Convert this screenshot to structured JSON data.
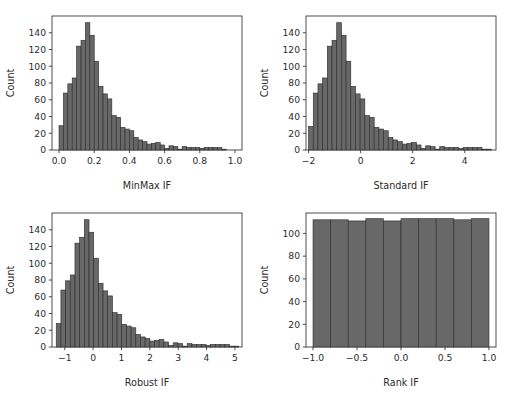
{
  "figure": {
    "title": "",
    "layout": "2x2 grid of histograms",
    "background_color": "#ffffff",
    "bar_color": "#686868",
    "bar_edge_color": "#2f2f2f",
    "axis_color": "#3a3a3a"
  },
  "chart_data": [
    {
      "type": "bar",
      "panel": "top-left",
      "title": "",
      "xlabel": "MinMax IF",
      "ylabel": "Count",
      "grid": false,
      "legend": "none",
      "xlim": [
        -0.04,
        1.04
      ],
      "ylim": [
        0,
        160
      ],
      "xticks": [
        0.0,
        0.2,
        0.4,
        0.6,
        0.8,
        1.0
      ],
      "xticklabels": [
        "0.0",
        "0.2",
        "0.4",
        "0.6",
        "0.8",
        "1.0"
      ],
      "yticks": [
        0,
        20,
        40,
        60,
        80,
        100,
        120,
        140
      ],
      "yticklabels": [
        "0",
        "20",
        "40",
        "60",
        "80",
        "100",
        "120",
        "140"
      ],
      "bin_edges": [
        0.0,
        0.025,
        0.05,
        0.075,
        0.1,
        0.125,
        0.15,
        0.175,
        0.2,
        0.225,
        0.25,
        0.275,
        0.3,
        0.325,
        0.35,
        0.375,
        0.4,
        0.425,
        0.45,
        0.475,
        0.5,
        0.525,
        0.55,
        0.575,
        0.6,
        0.625,
        0.65,
        0.675,
        0.7,
        0.725,
        0.75,
        0.775,
        0.8,
        0.825,
        0.85,
        0.875,
        0.9,
        0.925,
        0.95,
        0.975,
        1.0
      ],
      "values": [
        29,
        68,
        79,
        86,
        124,
        131,
        152,
        137,
        106,
        76,
        67,
        61,
        41,
        39,
        27,
        25,
        23,
        15,
        12,
        10,
        7,
        8,
        9,
        6,
        2,
        5,
        4,
        1,
        4,
        3,
        3,
        3,
        2,
        3,
        3,
        3,
        3,
        1
      ]
    },
    {
      "type": "bar",
      "panel": "top-right",
      "title": "",
      "xlabel": "Standard IF",
      "ylabel": "Count",
      "grid": false,
      "legend": "none",
      "xlim": [
        -2.1,
        5.2
      ],
      "ylim": [
        0,
        160
      ],
      "xticks": [
        -2,
        0,
        2,
        4
      ],
      "xticklabels": [
        "-2",
        "0",
        "2",
        "4"
      ],
      "yticks": [
        0,
        20,
        40,
        60,
        80,
        100,
        120,
        140
      ],
      "yticklabels": [
        "0",
        "20",
        "40",
        "60",
        "80",
        "100",
        "120",
        "140"
      ],
      "bin_edges": [
        -2.0,
        -1.82,
        -1.64,
        -1.46,
        -1.28,
        -1.1,
        -0.92,
        -0.74,
        -0.56,
        -0.38,
        -0.2,
        -0.02,
        0.16,
        0.34,
        0.52,
        0.7,
        0.88,
        1.06,
        1.24,
        1.42,
        1.6,
        1.78,
        1.96,
        2.14,
        2.32,
        2.5,
        2.68,
        2.86,
        3.04,
        3.22,
        3.4,
        3.58,
        3.76,
        3.94,
        4.12,
        4.3,
        4.48,
        4.66,
        4.84,
        5.02
      ],
      "values": [
        28,
        68,
        79,
        86,
        124,
        131,
        152,
        137,
        106,
        76,
        67,
        61,
        41,
        39,
        27,
        25,
        23,
        15,
        12,
        10,
        7,
        8,
        9,
        6,
        2,
        5,
        4,
        1,
        4,
        3,
        3,
        3,
        2,
        3,
        3,
        3,
        3,
        1,
        1
      ]
    },
    {
      "type": "bar",
      "panel": "bottom-left",
      "title": "",
      "xlabel": "Robust IF",
      "ylabel": "Count",
      "grid": false,
      "legend": "none",
      "xlim": [
        -1.45,
        5.25
      ],
      "ylim": [
        0,
        160
      ],
      "xticks": [
        -1,
        0,
        1,
        2,
        3,
        4,
        5
      ],
      "xticklabels": [
        "-1",
        "0",
        "1",
        "2",
        "3",
        "4",
        "5"
      ],
      "yticks": [
        0,
        20,
        40,
        60,
        80,
        100,
        120,
        140
      ],
      "yticklabels": [
        "0",
        "20",
        "40",
        "60",
        "80",
        "100",
        "120",
        "140"
      ],
      "bin_edges": [
        -1.3,
        -1.135,
        -0.97,
        -0.805,
        -0.64,
        -0.475,
        -0.31,
        -0.145,
        0.02,
        0.185,
        0.35,
        0.515,
        0.68,
        0.845,
        1.01,
        1.175,
        1.34,
        1.505,
        1.67,
        1.835,
        2.0,
        2.165,
        2.33,
        2.495,
        2.66,
        2.825,
        2.99,
        3.155,
        3.32,
        3.485,
        3.65,
        3.815,
        3.98,
        4.145,
        4.31,
        4.475,
        4.64,
        4.805,
        4.97,
        5.135
      ],
      "values": [
        28,
        68,
        79,
        86,
        124,
        131,
        152,
        137,
        106,
        76,
        67,
        61,
        41,
        39,
        27,
        25,
        23,
        15,
        12,
        10,
        7,
        8,
        9,
        6,
        2,
        5,
        4,
        1,
        4,
        3,
        3,
        3,
        2,
        3,
        3,
        3,
        3,
        1,
        1
      ]
    },
    {
      "type": "bar",
      "panel": "bottom-right",
      "title": "",
      "xlabel": "Rank IF",
      "ylabel": "Count",
      "grid": false,
      "legend": "none",
      "xlim": [
        -1.08,
        1.08
      ],
      "ylim": [
        0,
        118
      ],
      "xticks": [
        -1.0,
        -0.5,
        0.0,
        0.5,
        1.0
      ],
      "xticklabels": [
        "-1.0",
        "-0.5",
        "0.0",
        "0.5",
        "1.0"
      ],
      "yticks": [
        0,
        20,
        40,
        60,
        80,
        100
      ],
      "yticklabels": [
        "0",
        "20",
        "40",
        "60",
        "80",
        "100"
      ],
      "bin_edges": [
        -1.0,
        -0.8,
        -0.6,
        -0.4,
        -0.2,
        0.0,
        0.2,
        0.4,
        0.6,
        0.8,
        1.0
      ],
      "values": [
        112,
        112,
        111,
        113,
        111,
        113,
        113,
        113,
        112,
        113
      ]
    }
  ]
}
